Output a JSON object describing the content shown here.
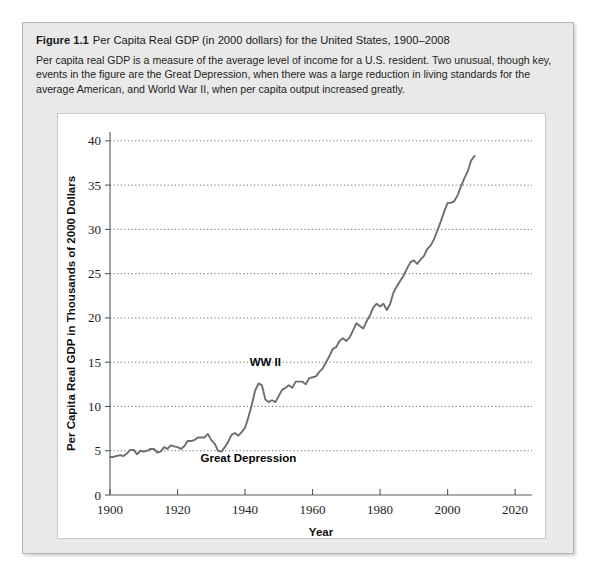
{
  "figure": {
    "label": "Figure 1.1",
    "title": "Per Capita Real GDP (in 2000 dollars) for the United States, 1900–2008",
    "caption": "Per capita real GDP is a measure of the average level of income for a U.S. resident. Two unusual, though key, events in the figure are the Great Depression, when there was a large reduction in living standards for the average American, and World War II, when per capita output increased greatly."
  },
  "colors": {
    "panel_background": "#e9e9e9",
    "panel_border": "#b4b4b4",
    "chart_background": "#ffffff",
    "line": "#6b6e73",
    "grid": "#6e6e6e",
    "axis": "#55585c",
    "text": "#1a1a1a"
  },
  "chart_data": {
    "type": "line",
    "title": "Per Capita Real GDP (in 2000 dollars) for the United States, 1900–2008",
    "xlabel": "Year",
    "ylabel": "Per Capita Real GDP in Thousands of 2000 Dollars",
    "xlim": [
      1900,
      2025
    ],
    "ylim": [
      0,
      41
    ],
    "xticks": [
      1900,
      1920,
      1940,
      1960,
      1980,
      2000,
      2020
    ],
    "xtick_labels": [
      "1900",
      "1920",
      "1940",
      "1960",
      "1980",
      "2000",
      "2020"
    ],
    "yticks": [
      0,
      5,
      10,
      15,
      20,
      25,
      30,
      35,
      40
    ],
    "ytick_labels": [
      "0",
      "5",
      "10",
      "15",
      "20",
      "25",
      "30",
      "35",
      "40"
    ],
    "grid": "horizontal-dotted",
    "gridlines_at": [
      5,
      10,
      15,
      20,
      25,
      30,
      35,
      40
    ],
    "legend": null,
    "annotations": [
      {
        "text": "WW II",
        "x": 1946,
        "y": 14.6
      },
      {
        "text": "Great Depression",
        "x": 1941,
        "y": 3.7
      }
    ],
    "series": [
      {
        "name": "Per capita real GDP",
        "x": [
          1900,
          1901,
          1902,
          1903,
          1904,
          1905,
          1906,
          1907,
          1908,
          1909,
          1910,
          1911,
          1912,
          1913,
          1914,
          1915,
          1916,
          1917,
          1918,
          1919,
          1920,
          1921,
          1922,
          1923,
          1924,
          1925,
          1926,
          1927,
          1928,
          1929,
          1930,
          1931,
          1932,
          1933,
          1934,
          1935,
          1936,
          1937,
          1938,
          1939,
          1940,
          1941,
          1942,
          1943,
          1944,
          1945,
          1946,
          1947,
          1948,
          1949,
          1950,
          1951,
          1952,
          1953,
          1954,
          1955,
          1956,
          1957,
          1958,
          1959,
          1960,
          1961,
          1962,
          1963,
          1964,
          1965,
          1966,
          1967,
          1968,
          1969,
          1970,
          1971,
          1972,
          1973,
          1974,
          1975,
          1976,
          1977,
          1978,
          1979,
          1980,
          1981,
          1982,
          1983,
          1984,
          1985,
          1986,
          1987,
          1988,
          1989,
          1990,
          1991,
          1992,
          1993,
          1994,
          1995,
          1996,
          1997,
          1998,
          1999,
          2000,
          2001,
          2002,
          2003,
          2004,
          2005,
          2006,
          2007,
          2008
        ],
        "y": [
          4.3,
          4.3,
          4.4,
          4.5,
          4.4,
          4.7,
          5.1,
          5.1,
          4.6,
          5.0,
          4.9,
          5.0,
          5.2,
          5.2,
          4.8,
          4.9,
          5.4,
          5.2,
          5.6,
          5.5,
          5.4,
          5.2,
          5.5,
          6.1,
          6.1,
          6.2,
          6.5,
          6.5,
          6.5,
          6.9,
          6.2,
          5.8,
          5.0,
          4.9,
          5.4,
          6.0,
          6.8,
          7.0,
          6.7,
          7.1,
          7.6,
          8.8,
          10.2,
          11.8,
          12.6,
          12.4,
          10.8,
          10.5,
          10.7,
          10.5,
          11.2,
          11.9,
          12.1,
          12.4,
          12.1,
          12.8,
          12.8,
          12.8,
          12.5,
          13.2,
          13.3,
          13.4,
          13.9,
          14.3,
          15.0,
          15.7,
          16.5,
          16.7,
          17.4,
          17.7,
          17.4,
          17.8,
          18.6,
          19.4,
          19.1,
          18.8,
          19.6,
          20.3,
          21.2,
          21.6,
          21.3,
          21.6,
          20.9,
          21.6,
          22.9,
          23.6,
          24.2,
          24.8,
          25.6,
          26.3,
          26.5,
          26.1,
          26.6,
          27.0,
          27.8,
          28.2,
          28.9,
          29.9,
          30.9,
          32.0,
          33.0,
          33.0,
          33.2,
          33.9,
          34.9,
          35.8,
          36.6,
          37.8,
          38.3
        ],
        "color": "#6b6e73"
      }
    ]
  }
}
